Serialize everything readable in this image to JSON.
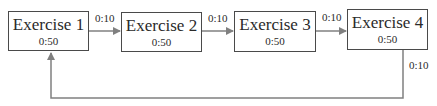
{
  "diagram": {
    "type": "circuit-flow",
    "colors": {
      "line": "#808080",
      "border": "#4a4a4a",
      "text": "#2a2a2a"
    },
    "exercises": [
      {
        "label": "Exercise 1",
        "duration": "0:50"
      },
      {
        "label": "Exercise 2",
        "duration": "0:50"
      },
      {
        "label": "Exercise 3",
        "duration": "0:50"
      },
      {
        "label": "Exercise 4",
        "duration": "0:50"
      }
    ],
    "transitions": [
      {
        "from": "Exercise 1",
        "to": "Exercise 2",
        "rest": "0:10"
      },
      {
        "from": "Exercise 2",
        "to": "Exercise 3",
        "rest": "0:10"
      },
      {
        "from": "Exercise 3",
        "to": "Exercise 4",
        "rest": "0:10"
      },
      {
        "from": "Exercise 4",
        "to": "Exercise 1",
        "rest": "0:10"
      }
    ]
  }
}
